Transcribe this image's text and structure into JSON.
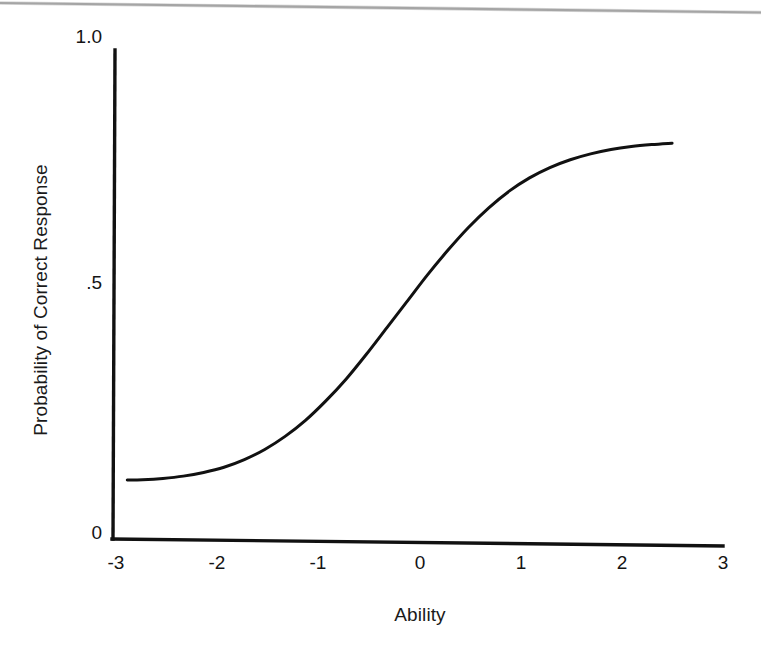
{
  "figure": {
    "background_color": "#ffffff",
    "ink_color": "#111111",
    "rule_color": "#8d8d8d"
  },
  "chart_data": {
    "type": "line",
    "title": "",
    "subtitle": "",
    "xlabel": "Ability",
    "ylabel": "Probability of Correct Response",
    "xlim": [
      -3,
      3
    ],
    "ylim": [
      0,
      1
    ],
    "xticks": [
      -3,
      -2,
      -1,
      0,
      1,
      2,
      3
    ],
    "xtick_labels": [
      "-3",
      "-2",
      "-1",
      "0",
      "1",
      "2",
      "3"
    ],
    "yticks": [
      0,
      0.5,
      1.0
    ],
    "ytick_labels": [
      "0",
      ".5",
      "1.0"
    ],
    "grid": false,
    "legend": null,
    "annotations": [],
    "series": [
      {
        "name": "Item Characteristic Curve",
        "color": "#111111",
        "line_width": 3,
        "x": [
          -2.85,
          -2.7,
          -2.5,
          -2.3,
          -2.1,
          -1.9,
          -1.7,
          -1.5,
          -1.3,
          -1.1,
          -0.9,
          -0.7,
          -0.5,
          -0.3,
          -0.1,
          0.1,
          0.3,
          0.5,
          0.7,
          0.9,
          1.1,
          1.3,
          1.5,
          1.7,
          1.9,
          2.1,
          2.3,
          2.5
        ],
        "y": [
          0.121,
          0.122,
          0.125,
          0.13,
          0.138,
          0.149,
          0.165,
          0.186,
          0.213,
          0.246,
          0.286,
          0.331,
          0.382,
          0.436,
          0.49,
          0.544,
          0.594,
          0.64,
          0.68,
          0.714,
          0.741,
          0.762,
          0.778,
          0.79,
          0.799,
          0.805,
          0.809,
          0.812
        ]
      }
    ]
  },
  "axes": {
    "x_axis_name": "horizontal-axis",
    "y_axis_name": "vertical-axis"
  }
}
